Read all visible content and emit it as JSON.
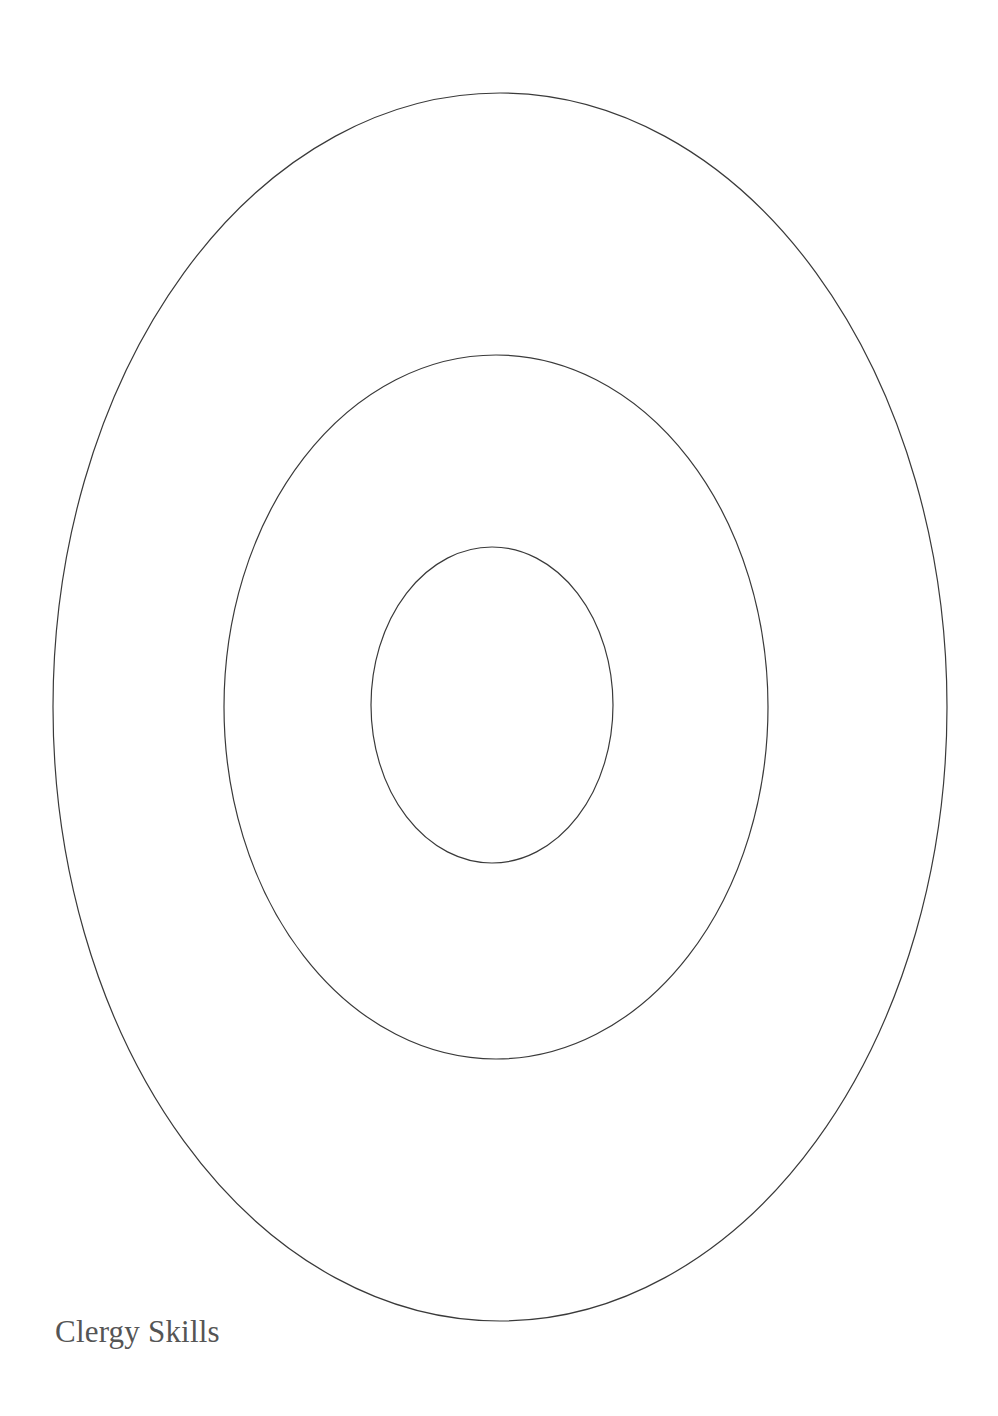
{
  "diagram": {
    "type": "concentric-ellipses",
    "background": "#ffffff",
    "stroke_color": "#3a3a3a",
    "caption_color": "#555555",
    "ellipses": [
      {
        "name": "outer",
        "cx": 500,
        "cy": 707,
        "rx": 447,
        "ry": 614
      },
      {
        "name": "middle",
        "cx": 496,
        "cy": 707,
        "rx": 272,
        "ry": 352
      },
      {
        "name": "inner",
        "cx": 492,
        "cy": 705,
        "rx": 121,
        "ry": 158
      }
    ]
  },
  "caption": {
    "text": "Clergy Skills"
  }
}
